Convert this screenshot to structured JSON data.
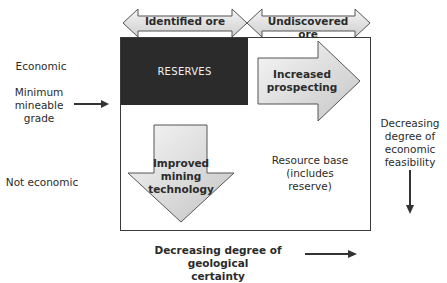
{
  "top_arrows": {
    "identified_ore": "Identified ore",
    "undiscovered_ore": "Undiscovered ore"
  },
  "left_labels": {
    "economic": "Economic",
    "minimum_mineable_grade": [
      "Minimum",
      "mineable",
      "grade"
    ],
    "not_economic": "Not economic"
  },
  "box": {
    "reserves": "RESERVES",
    "increased_prospecting": [
      "Increased",
      "prospecting"
    ],
    "improved_mining_technology": [
      "Improved",
      "mining",
      "technology"
    ],
    "resource_base": [
      "Resource base",
      "(includes",
      "reserve)"
    ]
  },
  "right_axis": {
    "label": [
      "Decreasing",
      "degree of",
      "economic",
      "feasibility"
    ]
  },
  "bottom_axis": {
    "label": [
      "Decreasing degree of geological",
      "certainty"
    ]
  },
  "colors": {
    "reserves_fill": "#2b2b2b",
    "arrow_fill_light": "#f2f2f2",
    "arrow_fill_dark": "#c8c8c8",
    "outline": "#3a3a3a"
  }
}
